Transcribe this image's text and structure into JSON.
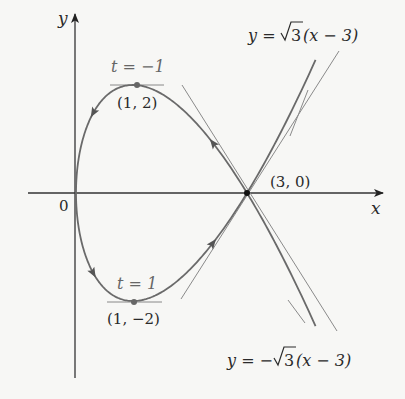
{
  "figure": {
    "axes": {
      "x_label": "x",
      "y_label": "y",
      "origin_label": "0"
    },
    "points": {
      "top": {
        "coords": "(1, 2)",
        "param": "t = −1"
      },
      "bottom": {
        "coords": "(1, −2)",
        "param": "t = 1"
      },
      "crossing": {
        "coords": "(3, 0)"
      }
    },
    "tangent_lines": {
      "positive": {
        "prefix": "y = ",
        "radicand": "3",
        "suffix": "(x − 3)"
      },
      "negative": {
        "prefix": "y = −",
        "radicand": "3",
        "suffix": "(x − 3)"
      }
    },
    "colors": {
      "background": "#f7f7f5",
      "curve": "#6a6a6a",
      "axes": "#333333",
      "tangent": "#8a8a8a",
      "point": "#555555"
    }
  }
}
